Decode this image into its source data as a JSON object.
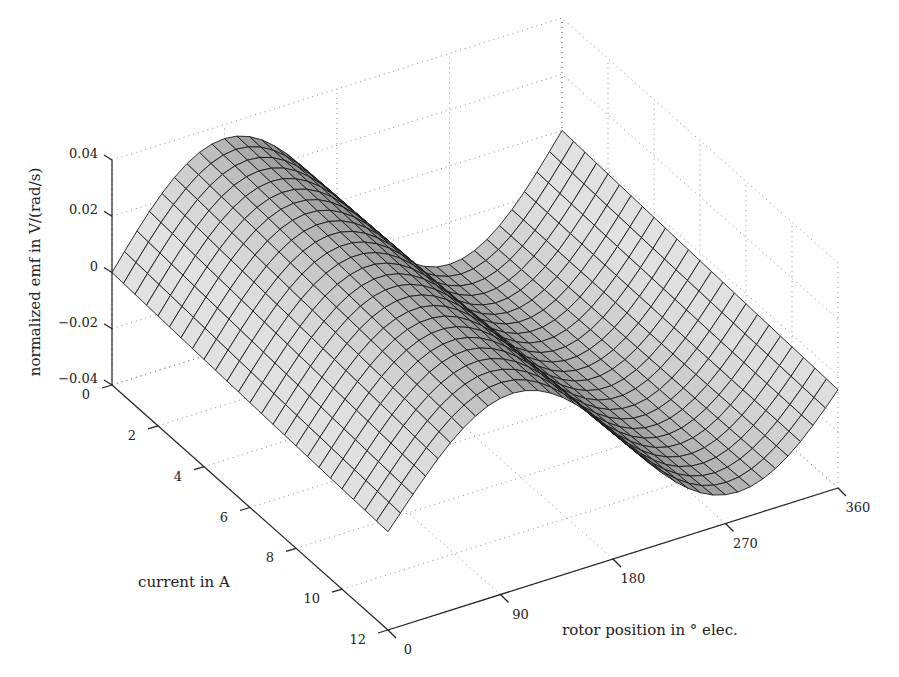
{
  "chart_data": {
    "type": "surface",
    "title": "",
    "xlabel": "rotor position in ° elec.",
    "ylabel": "current in A",
    "zlabel": "normalized emf in V/(rad/s)",
    "x_ticks": [
      0,
      90,
      180,
      270,
      360
    ],
    "y_ticks": [
      0,
      2,
      4,
      6,
      8,
      10,
      12
    ],
    "z_ticks": [
      0.04,
      0.02,
      0,
      -0.02,
      -0.04
    ],
    "z_tick_labels": [
      "0.04",
      "0.02",
      "0",
      "−0.02",
      "−0.04"
    ],
    "xlim": [
      0,
      360
    ],
    "ylim": [
      0,
      12
    ],
    "zlim": [
      -0.04,
      0.04
    ],
    "grid": true,
    "colormap": "gray",
    "mesh": {
      "x_steps": 36,
      "y_steps": 12
    },
    "surface_model": "emf(θ, i) = A(i) · sin(θ + φ(i)), amplitude ≈ 0.034 at low current, decreasing slightly and phase-shifting with current",
    "samples": [
      {
        "current": 0,
        "peak_emf": 0.035,
        "peak_position": 90,
        "min_emf": -0.035,
        "min_position": 270
      },
      {
        "current": 6,
        "peak_emf": 0.033,
        "peak_position": 95,
        "min_emf": -0.033,
        "min_position": 275
      },
      {
        "current": 12,
        "peak_emf": 0.03,
        "peak_position": 100,
        "min_emf": -0.03,
        "min_position": 280
      }
    ]
  }
}
